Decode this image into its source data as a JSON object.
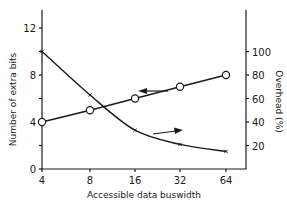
{
  "chart_data": {
    "type": "line",
    "title": "",
    "xlabel": "Accessible data buswidth",
    "ylabel": "Number of extra bits",
    "y2label": "Overhead (%)",
    "categories": [
      "4",
      "8",
      "16",
      "32",
      "64"
    ],
    "x": [
      4,
      8,
      16,
      32,
      64
    ],
    "xscale": "log2",
    "ylim": [
      0,
      14
    ],
    "y2lim": [
      0,
      140
    ],
    "yticks": [
      0,
      2,
      4,
      6,
      8,
      10,
      12
    ],
    "yticklabels": [
      "0",
      "",
      "4",
      "",
      "8",
      "",
      "12"
    ],
    "y2ticks": [
      20,
      40,
      60,
      80,
      100
    ],
    "y2ticklabels": [
      "20",
      "40",
      "60",
      "80",
      "100"
    ],
    "grid": false,
    "series": [
      {
        "name": "Number of extra bits",
        "axis": "left",
        "marker": "open-circle",
        "values": [
          4,
          5,
          6,
          7,
          8
        ]
      },
      {
        "name": "Overhead (%)",
        "axis": "right",
        "marker": "cross",
        "values": [
          100,
          63,
          33,
          21,
          15
        ]
      }
    ],
    "annotations": [
      {
        "type": "arrow",
        "direction": "left",
        "points_to": "left axis",
        "near_series": "Number of extra bits"
      },
      {
        "type": "arrow",
        "direction": "right",
        "points_to": "right axis",
        "near_series": "Overhead (%)"
      }
    ]
  }
}
